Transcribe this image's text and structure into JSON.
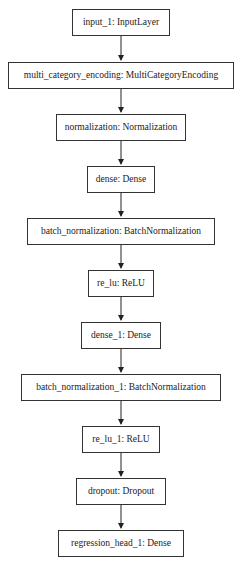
{
  "diagram": {
    "type": "keras_model_plot",
    "nodes": [
      {
        "id": "n0",
        "label": "input_1: InputLayer"
      },
      {
        "id": "n1",
        "label": "multi_category_encoding: MultiCategoryEncoding"
      },
      {
        "id": "n2",
        "label": "normalization: Normalization"
      },
      {
        "id": "n3",
        "label": "dense: Dense"
      },
      {
        "id": "n4",
        "label": "batch_normalization: BatchNormalization"
      },
      {
        "id": "n5",
        "label": "re_lu: ReLU"
      },
      {
        "id": "n6",
        "label": "dense_1: Dense"
      },
      {
        "id": "n7",
        "label": "batch_normalization_1: BatchNormalization"
      },
      {
        "id": "n8",
        "label": "re_lu_1: ReLU"
      },
      {
        "id": "n9",
        "label": "dropout: Dropout"
      },
      {
        "id": "n10",
        "label": "regression_head_1: Dense"
      }
    ],
    "edges": [
      [
        "n0",
        "n1"
      ],
      [
        "n1",
        "n2"
      ],
      [
        "n2",
        "n3"
      ],
      [
        "n3",
        "n4"
      ],
      [
        "n4",
        "n5"
      ],
      [
        "n5",
        "n6"
      ],
      [
        "n6",
        "n7"
      ],
      [
        "n7",
        "n8"
      ],
      [
        "n8",
        "n9"
      ],
      [
        "n9",
        "n10"
      ]
    ]
  }
}
